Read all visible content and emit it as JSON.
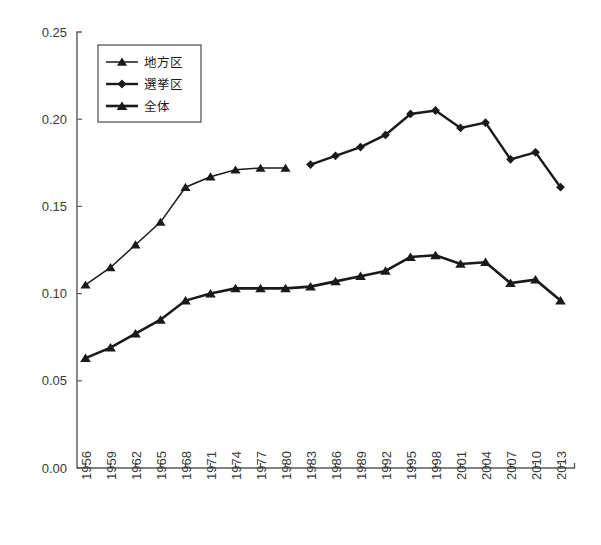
{
  "chart_data": {
    "type": "line",
    "title": "",
    "xlabel": "",
    "ylabel": "",
    "ylim": [
      0.0,
      0.25
    ],
    "ytick_labels": [
      "0.25",
      "0.20",
      "0.15",
      "0.10",
      "0.05",
      "0.00"
    ],
    "ytick_values": [
      0.25,
      0.2,
      0.15,
      0.1,
      0.05,
      0.0
    ],
    "grid": false,
    "legend_position": "top-left",
    "categories": [
      "1956",
      "1959",
      "1962",
      "1965",
      "1968",
      "1971",
      "1974",
      "1977",
      "1980",
      "1983",
      "1986",
      "1989",
      "1992",
      "1995",
      "1998",
      "2001",
      "2004",
      "2007",
      "2010",
      "2013"
    ],
    "series": [
      {
        "name": "地方区",
        "marker": "triangle",
        "values": [
          0.105,
          0.115,
          0.128,
          0.141,
          0.161,
          0.167,
          0.171,
          0.172,
          0.172,
          null,
          null,
          null,
          null,
          null,
          null,
          null,
          null,
          null,
          null,
          null
        ]
      },
      {
        "name": "選挙区",
        "marker": "diamond",
        "values": [
          null,
          null,
          null,
          null,
          null,
          null,
          null,
          null,
          null,
          0.174,
          0.179,
          0.184,
          0.191,
          0.203,
          0.205,
          0.195,
          0.198,
          0.177,
          0.181,
          0.161
        ]
      },
      {
        "name": "全体",
        "marker": "triangle",
        "values": [
          0.063,
          0.069,
          0.077,
          0.085,
          0.096,
          0.1,
          0.103,
          0.103,
          0.103,
          0.104,
          0.107,
          0.11,
          0.113,
          0.121,
          0.122,
          0.117,
          0.118,
          0.106,
          0.108,
          0.096
        ]
      }
    ]
  },
  "legend": {
    "entries": [
      {
        "label": "地方区"
      },
      {
        "label": "選挙区"
      },
      {
        "label": "全体"
      }
    ]
  },
  "colors": {
    "line": "#1a1a1a",
    "axis": "#595959",
    "text": "#3a3a3a",
    "background": "#ffffff"
  }
}
